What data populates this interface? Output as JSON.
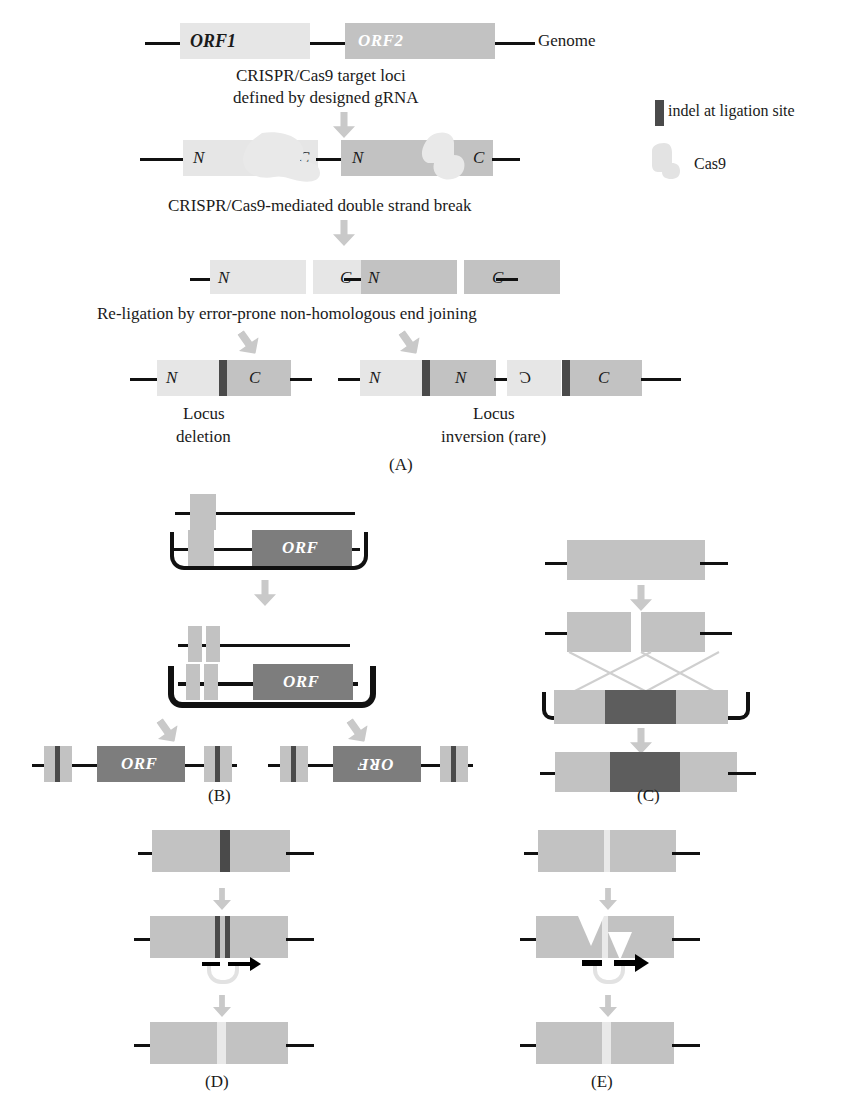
{
  "figure": {
    "panels": [
      "(A)",
      "(B)",
      "(C)",
      "(D)",
      "(E)"
    ]
  },
  "legend": {
    "indel_label": "indel at ligation site",
    "cas9_label": "Cas9",
    "indel_color": "#4a4a4a",
    "cas9_color": "#e6e6e6"
  },
  "panelA": {
    "label": "(A)",
    "row1": {
      "orf1": "ORF1",
      "orf2": "ORF2",
      "genome": "Genome"
    },
    "step1_text_line1": "CRISPR/Cas9 target loci",
    "step1_text_line2": "defined by designed gRNA",
    "row2": {
      "n1": "N",
      "c1": "C",
      "n2": "N",
      "c2": "C"
    },
    "step2_text": "CRISPR/Cas9-mediated double strand break",
    "row3": {
      "n1": "N",
      "c1": "C",
      "n2": "N",
      "c2": "C"
    },
    "step3_text": "Re-ligation by error-prone non-homologous end joining",
    "outcome_left": {
      "n": "N",
      "c": "C",
      "caption_line1": "Locus",
      "caption_line2": "deletion"
    },
    "outcome_right": {
      "n1": "N",
      "n2": "N",
      "c_reversed": "C",
      "c2": "C",
      "caption_line1": "Locus",
      "caption_line2": "inversion (rare)"
    }
  },
  "panelB": {
    "label": "(B)",
    "orf_label": "ORF",
    "orf_label_inverted": "ORF"
  },
  "panelC": {
    "label": "(C)"
  },
  "panelD": {
    "label": "(D)"
  },
  "panelE": {
    "label": "(E)"
  },
  "colors": {
    "light_gray": "#e6e6e6",
    "medium_gray": "#c2c2c2",
    "dark_gray": "#7d7d7d",
    "darker_gray": "#5d5d5d",
    "indel_dark": "#4a4a4a",
    "arrow_gray": "#c9c9c9",
    "line_black": "#111111"
  }
}
